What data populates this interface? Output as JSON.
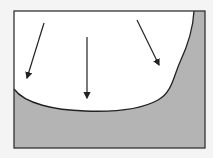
{
  "diagram": {
    "colors": {
      "background": "#f4f4f4",
      "frame_stroke": "#333333",
      "upper_region": "#ffffff",
      "lower_region": "#b4b4b4",
      "arrow": "#222222",
      "curve": "#222222"
    },
    "arrows": [
      {
        "id": "left",
        "from": [
          44,
          23
        ],
        "to": [
          26,
          81
        ]
      },
      {
        "id": "center",
        "from": [
          87,
          37
        ],
        "to": [
          87,
          101
        ]
      },
      {
        "id": "right",
        "from": [
          137,
          20
        ],
        "to": [
          160,
          68
        ]
      }
    ]
  }
}
